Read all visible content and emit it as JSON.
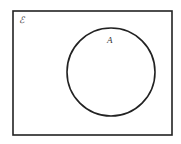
{
  "diagram": {
    "type": "venn",
    "universal_set": {
      "label": "ℰ",
      "rect": {
        "x": 13,
        "y": 11,
        "width": 159,
        "height": 124
      }
    },
    "sets": [
      {
        "label": "A",
        "cx": 111,
        "cy": 72,
        "r": 44
      }
    ],
    "colors": {
      "stroke": "#222222",
      "fill": "#ffffff"
    }
  }
}
